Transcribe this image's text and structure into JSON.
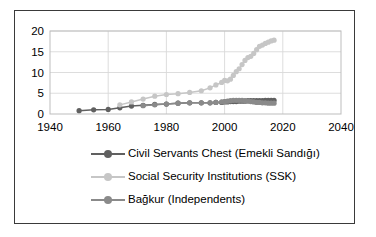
{
  "chart_data": {
    "type": "line",
    "title": "",
    "xlabel": "",
    "ylabel": "",
    "xlim": [
      1940,
      2040
    ],
    "ylim": [
      0,
      20
    ],
    "xticks": [
      1940,
      1960,
      1980,
      2000,
      2020,
      2040
    ],
    "yticks": [
      0,
      5,
      10,
      15,
      20
    ],
    "grid": true,
    "legend_position": "bottom",
    "series": [
      {
        "name": "Civil Servants Chest (Emekli Sandığı)",
        "color": "#606060",
        "x": [
          1950,
          1955,
          1960,
          1964,
          1968,
          1972,
          1976,
          1980,
          1984,
          1988,
          1992,
          1995,
          1997,
          1999,
          2000,
          2001,
          2002,
          2003,
          2004,
          2005,
          2006,
          2007,
          2008,
          2009,
          2010,
          2011,
          2012,
          2013,
          2014,
          2015,
          2016,
          2017
        ],
        "values": [
          0.8,
          1.0,
          1.1,
          1.5,
          1.9,
          2.1,
          2.3,
          2.4,
          2.6,
          2.7,
          2.7,
          2.7,
          2.8,
          2.8,
          2.9,
          2.9,
          3.0,
          3.0,
          3.0,
          3.1,
          3.1,
          3.1,
          3.2,
          3.2,
          3.2,
          3.2,
          3.2,
          3.2,
          3.3,
          3.3,
          3.3,
          3.3
        ]
      },
      {
        "name": "Social Security Institutions (SSK)",
        "color": "#c6c6c6",
        "x": [
          1964,
          1968,
          1972,
          1976,
          1980,
          1984,
          1988,
          1992,
          1995,
          1997,
          1999,
          2000,
          2001,
          2002,
          2003,
          2004,
          2005,
          2006,
          2007,
          2008,
          2009,
          2010,
          2011,
          2012,
          2013,
          2014,
          2015,
          2016,
          2017
        ],
        "values": [
          2.2,
          2.9,
          3.6,
          4.3,
          4.7,
          4.9,
          5.2,
          5.6,
          6.3,
          7.0,
          7.6,
          8.1,
          8.0,
          8.4,
          9.3,
          10.2,
          10.9,
          11.9,
          12.9,
          13.6,
          13.9,
          14.6,
          15.5,
          16.3,
          16.6,
          17.0,
          17.3,
          17.6,
          17.8
        ]
      },
      {
        "name": "Bağkur (Independents)",
        "color": "#8a8a8a",
        "x": [
          1972,
          1976,
          1980,
          1984,
          1988,
          1992,
          1995,
          1997,
          1999,
          2000,
          2001,
          2002,
          2003,
          2004,
          2005,
          2006,
          2007,
          2008,
          2009,
          2010,
          2011,
          2012,
          2013,
          2014,
          2015,
          2016,
          2017
        ],
        "values": [
          2.0,
          2.2,
          2.4,
          2.6,
          2.7,
          2.7,
          2.7,
          2.8,
          2.9,
          3.0,
          3.1,
          3.2,
          3.3,
          3.3,
          3.3,
          3.3,
          3.2,
          3.1,
          3.0,
          2.9,
          2.8,
          2.8,
          2.7,
          2.7,
          2.6,
          2.6,
          2.6
        ]
      }
    ]
  },
  "legend": {
    "entries": [
      {
        "label": "Civil Servants Chest (Emekli Sandığı)"
      },
      {
        "label": "Social Security Institutions (SSK)"
      },
      {
        "label": "Bağkur (Independents)"
      }
    ]
  },
  "colors": {
    "frame": "#3a3a3a",
    "grid": "#d9d9d9",
    "axis": "#bdbdbd",
    "background": "#ffffff"
  }
}
